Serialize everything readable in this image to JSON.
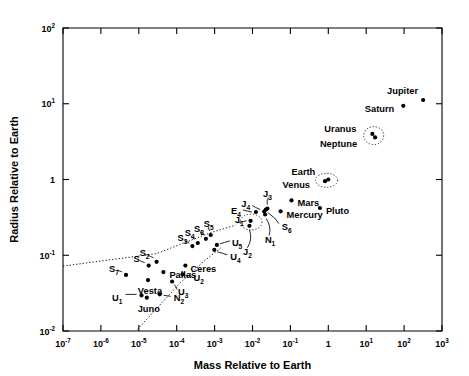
{
  "chart_data": {
    "type": "scatter",
    "title": "",
    "xlabel": "Mass Relative to Earth",
    "ylabel": "Radius Relative to Earth",
    "xlim": [
      1e-07,
      1000.0
    ],
    "ylim": [
      0.01,
      100
    ],
    "xscale": "log",
    "yscale": "log",
    "grid": false,
    "legend": null,
    "xticks": [
      {
        "value": 1e-07,
        "label": "10",
        "exp": "-7"
      },
      {
        "value": 1e-06,
        "label": "10",
        "exp": "-6"
      },
      {
        "value": 1e-05,
        "label": "10",
        "exp": "-5"
      },
      {
        "value": 0.0001,
        "label": "10",
        "exp": "-4"
      },
      {
        "value": 0.001,
        "label": "10",
        "exp": "-3"
      },
      {
        "value": 0.01,
        "label": "10",
        "exp": "-2"
      },
      {
        "value": 0.1,
        "label": "10",
        "exp": "-1"
      },
      {
        "value": 1,
        "label": "1",
        "exp": ""
      },
      {
        "value": 10,
        "label": "10",
        "exp": "1"
      },
      {
        "value": 100,
        "label": "10",
        "exp": "2"
      },
      {
        "value": 1000,
        "label": "10",
        "exp": "3"
      }
    ],
    "yticks": [
      {
        "value": 100,
        "label": "10",
        "exp": "2"
      },
      {
        "value": 10,
        "label": "10",
        "exp": "1"
      },
      {
        "value": 1,
        "label": "1",
        "exp": ""
      },
      {
        "value": 0.1,
        "label": "10",
        "exp": "-1"
      },
      {
        "value": 0.01,
        "label": "10",
        "exp": "-2"
      }
    ],
    "points": [
      {
        "name": "Jupiter",
        "x": 318,
        "y": 11.2,
        "label": "Jupiter",
        "lx": -5,
        "ly": -9,
        "anchor": "end"
      },
      {
        "name": "Saturn",
        "x": 95,
        "y": 9.4,
        "label": "Saturn",
        "lx": -9,
        "ly": 3,
        "anchor": "end"
      },
      {
        "name": "Uranus",
        "x": 14.6,
        "y": 4.0,
        "label": "Uranus",
        "lx": -16,
        "ly": -5,
        "anchor": "end"
      },
      {
        "name": "Neptune",
        "x": 17.2,
        "y": 3.6,
        "label": "Neptune",
        "lx": -18,
        "ly": 7,
        "anchor": "end"
      },
      {
        "name": "Earth",
        "x": 1.0,
        "y": 1.0,
        "label": "Earth",
        "lx": -13,
        "ly": -8,
        "anchor": "end"
      },
      {
        "name": "Venus",
        "x": 0.82,
        "y": 0.95,
        "label": "Venus",
        "lx": -15,
        "ly": 4,
        "anchor": "end"
      },
      {
        "name": "Mars",
        "x": 0.107,
        "y": 0.53,
        "label": "Mars",
        "lx": 6,
        "ly": 3,
        "anchor": "start"
      },
      {
        "name": "Mercury",
        "x": 0.055,
        "y": 0.38,
        "label": "Mercury",
        "lx": 6,
        "ly": 4,
        "anchor": "start"
      },
      {
        "name": "Pluto",
        "x": 0.6,
        "y": 0.42,
        "label": "Pluto",
        "lx": 6,
        "ly": 3,
        "anchor": "start"
      },
      {
        "name": "J1",
        "x": 0.0089,
        "y": 0.285,
        "label": "J",
        "sub": "1",
        "lx": -7,
        "ly": -1,
        "anchor": "end",
        "leader": [
          -4,
          0,
          -14,
          2
        ]
      },
      {
        "name": "J2",
        "x": 0.0083,
        "y": 0.245,
        "label": "J",
        "sub": "2",
        "lx": -2,
        "ly": 26,
        "anchor": "middle",
        "leader": [
          0,
          4,
          -2,
          22
        ]
      },
      {
        "name": "J3",
        "x": 0.0248,
        "y": 0.413,
        "label": "J",
        "sub": "3",
        "lx": 0,
        "ly": -15,
        "anchor": "middle",
        "leader": [
          0,
          -4,
          1,
          -11
        ]
      },
      {
        "name": "J4",
        "x": 0.0203,
        "y": 0.378,
        "label": "J",
        "sub": "4",
        "lx": -14,
        "ly": -8,
        "anchor": "end",
        "leader": [
          -4,
          -2,
          -12,
          -6
        ]
      },
      {
        "name": "E4",
        "x": 0.0123,
        "y": 0.372,
        "label": "E",
        "sub": "4",
        "lx": -15,
        "ly": -1,
        "anchor": "end",
        "leader": [
          -4,
          0,
          -13,
          -2
        ]
      },
      {
        "name": "S6",
        "x": 0.0225,
        "y": 0.4,
        "label": "S",
        "sub": "6",
        "lx": 16,
        "ly": 17,
        "anchor": "start",
        "leader": [
          2,
          3,
          13,
          14
        ]
      },
      {
        "name": "N1",
        "x": 0.0215,
        "y": 0.345,
        "label": "N",
        "sub": "1",
        "lx": 5,
        "ly": 25,
        "anchor": "middle",
        "leader": [
          1,
          4,
          4,
          21
        ]
      },
      {
        "name": "S5",
        "x": 0.00079,
        "y": 0.185,
        "label": "S",
        "sub": "5",
        "lx": -2,
        "ly": -11,
        "anchor": "middle",
        "leader": [
          -1,
          -4,
          -2,
          -8
        ]
      },
      {
        "name": "S8",
        "x": 0.00059,
        "y": 0.165,
        "label": "S",
        "sub": "8",
        "lx": -7,
        "ly": -10,
        "anchor": "middle",
        "leader": [
          -2,
          -4,
          -6,
          -7
        ]
      },
      {
        "name": "S4",
        "x": 0.00036,
        "y": 0.145,
        "label": "S",
        "sub": "4",
        "lx": -8,
        "ly": -10,
        "anchor": "middle",
        "leader": [
          -3,
          -4,
          -7,
          -7
        ]
      },
      {
        "name": "S3",
        "x": 0.00026,
        "y": 0.132,
        "label": "S",
        "sub": "3",
        "lx": -10,
        "ly": -8,
        "anchor": "middle",
        "leader": [
          -3,
          -3,
          -8,
          -6
        ]
      },
      {
        "name": "U5",
        "x": 0.00115,
        "y": 0.137,
        "label": "U",
        "sub": "5",
        "lx": 15,
        "ly": -2,
        "anchor": "start",
        "leader": [
          3,
          -1,
          13,
          -4
        ]
      },
      {
        "name": "U4",
        "x": 0.00098,
        "y": 0.118,
        "label": "U",
        "sub": "4",
        "lx": 16,
        "ly": 7,
        "anchor": "start",
        "leader": [
          3,
          2,
          13,
          5
        ]
      },
      {
        "name": "S2",
        "x": 2.95e-05,
        "y": 0.082,
        "label": "S",
        "sub": "2",
        "lx": -12,
        "ly": -9,
        "anchor": "middle",
        "leader": [
          -3,
          -4,
          -9,
          -7
        ]
      },
      {
        "name": "S",
        "x": 1.82e-05,
        "y": 0.073,
        "label": "S",
        "sub": "",
        "lx": -12,
        "ly": -7,
        "anchor": "middle",
        "leader": [
          -4,
          -3,
          -9,
          -5
        ]
      },
      {
        "name": "S7",
        "x": 4.6e-06,
        "y": 0.055,
        "label": "S",
        "sub": "7",
        "lx": -12,
        "ly": -6,
        "anchor": "middle",
        "leader": [
          -4,
          -3,
          -9,
          -5
        ]
      },
      {
        "name": "Ceres",
        "x": 0.00017,
        "y": 0.073,
        "label": "Ceres",
        "lx": 5,
        "ly": 3,
        "anchor": "start"
      },
      {
        "name": "Pallas",
        "x": 4.45e-05,
        "y": 0.06,
        "label": "Pallas",
        "lx": 6,
        "ly": 3,
        "anchor": "start"
      },
      {
        "name": "Vesta",
        "x": 1.75e-05,
        "y": 0.047,
        "label": "Vesta",
        "lx": 2,
        "ly": 11,
        "anchor": "middle"
      },
      {
        "name": "U2",
        "x": 0.000143,
        "y": 0.056,
        "label": "U",
        "sub": "2",
        "lx": 11,
        "ly": 4,
        "anchor": "start",
        "leader": [
          3,
          1,
          9,
          2
        ]
      },
      {
        "name": "U3",
        "x": 7.55e-05,
        "y": 0.045,
        "label": "U",
        "sub": "3",
        "lx": 6,
        "ly": 10,
        "anchor": "start",
        "leader": [
          2,
          3,
          5,
          8
        ]
      },
      {
        "name": "U1",
        "x": 1.18e-05,
        "y": 0.0295,
        "label": "U",
        "sub": "1",
        "lx": -19,
        "ly": 3,
        "anchor": "end",
        "leader": [
          -5,
          -1,
          -16,
          -1
        ]
      },
      {
        "name": "Juno",
        "x": 1.63e-05,
        "y": 0.0275,
        "label": "Juno",
        "lx": 2,
        "ly": 11,
        "anchor": "middle"
      },
      {
        "name": "N2",
        "x": 3.55e-05,
        "y": 0.0305,
        "label": "N",
        "sub": "2",
        "lx": 14,
        "ly": 4,
        "anchor": "start",
        "leader": [
          4,
          1,
          11,
          2
        ]
      }
    ],
    "group_rings": [
      {
        "name": "earth-venus-ring",
        "cx": 0.9,
        "cy": 0.975,
        "rx": 11,
        "ry": 7
      },
      {
        "name": "uranus-neptune-ring",
        "cx": 15.8,
        "cy": 3.8,
        "rx": 10,
        "ry": 9
      },
      {
        "name": "galilean-ring",
        "cx": 0.0092,
        "cy": 0.275,
        "rx": 11,
        "ry": 8
      }
    ],
    "boundary_lines": [
      {
        "name": "upper-dotted-boundary",
        "points": [
          [
            1e-07,
            0.072
          ],
          [
            2.95e-05,
            0.105
          ],
          [
            0.00072,
            0.196
          ],
          [
            0.0036,
            0.25
          ]
        ]
      },
      {
        "name": "lower-dotted-boundary",
        "points": [
          [
            9.2e-06,
            0.0105
          ],
          [
            0.00012,
            0.0425
          ],
          [
            0.00052,
            0.083
          ],
          [
            0.00145,
            0.125
          ]
        ]
      }
    ]
  }
}
